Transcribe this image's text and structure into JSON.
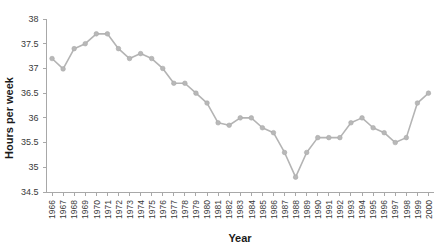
{
  "chart_data": {
    "type": "line",
    "title": "",
    "xlabel": "Year",
    "ylabel": "Hours per week",
    "ylim": [
      34.5,
      38
    ],
    "yticks": [
      34.5,
      35,
      35.5,
      36,
      36.5,
      37,
      37.5,
      38
    ],
    "ytick_labels": [
      "34.5",
      "35",
      "35.5",
      "36",
      "36.5",
      "37",
      "37.5",
      "38"
    ],
    "grid": false,
    "legend": "none",
    "marker": "circle",
    "line_color": "#b4b4b4",
    "marker_color": "#b8b8b8",
    "axis_color": "#a8a8a8",
    "categories": [
      "1966",
      "1967",
      "1968",
      "1969",
      "1970",
      "1971",
      "1972",
      "1973",
      "1974",
      "1975",
      "1976",
      "1977",
      "1978",
      "1979",
      "1980",
      "1981",
      "1982",
      "1983",
      "1984",
      "1985",
      "1986",
      "1987",
      "1988",
      "1989",
      "1990",
      "1991",
      "1992",
      "1993",
      "1994",
      "1995",
      "1996",
      "1997",
      "1998",
      "1999",
      "2000"
    ],
    "values": [
      37.2,
      36.99,
      37.4,
      37.5,
      37.7,
      37.7,
      37.4,
      37.2,
      37.3,
      37.2,
      37.0,
      36.7,
      36.7,
      36.5,
      36.3,
      35.9,
      35.85,
      36.0,
      36.0,
      35.8,
      35.7,
      35.3,
      34.8,
      35.3,
      35.6,
      35.6,
      35.6,
      35.9,
      36.0,
      35.8,
      35.7,
      35.5,
      35.6,
      36.3,
      36.5
    ],
    "series_name": "Average weekly hours"
  }
}
